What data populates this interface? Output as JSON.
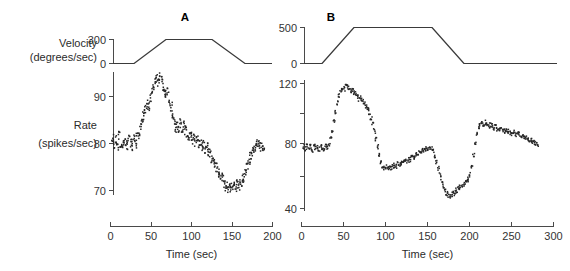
{
  "figure": {
    "width": 570,
    "height": 271,
    "background": "#ffffff",
    "ink_color": "#333333"
  },
  "labels": {
    "velocity_line1": "Velocity",
    "velocity_line2": "(degrees/sec)",
    "rate_line1": "Rate",
    "rate_line2": "(spikes/sec)",
    "panel_a_letter": "A",
    "panel_b_letter": "B",
    "xaxis_title_a": "Time (sec)",
    "xaxis_title_b": "Time (sec)"
  },
  "panelA": {
    "velocity_ticks": [
      "300",
      "0"
    ],
    "rate_ticks": [
      "90",
      "80",
      "70"
    ],
    "time_ticks": [
      "0",
      "50",
      "100",
      "150",
      "200"
    ]
  },
  "panelB": {
    "velocity_ticks": [
      "500",
      "0"
    ],
    "rate_ticks": [
      "120",
      "80",
      "40"
    ],
    "time_ticks": [
      "0",
      "50",
      "100",
      "150",
      "200",
      "250",
      "300"
    ]
  },
  "chart_data": [
    {
      "type": "line",
      "id": "panel-a-velocity",
      "title": "A",
      "xlabel": "Time (sec)",
      "ylabel": "Velocity (degrees/sec)",
      "xlim": [
        0,
        200
      ],
      "ylim": [
        0,
        300
      ],
      "grid": false,
      "legend": "none",
      "series": [
        {
          "name": "stimulus velocity",
          "x": [
            0,
            25,
            65,
            122,
            165,
            200
          ],
          "values": [
            0,
            0,
            300,
            300,
            0,
            0
          ]
        }
      ]
    },
    {
      "type": "scatter",
      "id": "panel-a-rate",
      "xlabel": "Time (sec)",
      "ylabel": "Rate (spikes/sec)",
      "xlim": [
        0,
        200
      ],
      "ylim": [
        66,
        97
      ],
      "grid": false,
      "legend": "none",
      "series": [
        {
          "name": "firing rate",
          "x": [
            2,
            4,
            6,
            8,
            10,
            12,
            14,
            16,
            18,
            20,
            22,
            24,
            26,
            28,
            30,
            32,
            34,
            36,
            38,
            40,
            42,
            44,
            46,
            48,
            50,
            52,
            54,
            56,
            58,
            60,
            62,
            64,
            66,
            68,
            70,
            72,
            74,
            76,
            78,
            80,
            82,
            84,
            86,
            88,
            90,
            92,
            94,
            96,
            98,
            100,
            102,
            104,
            106,
            108,
            110,
            112,
            114,
            116,
            118,
            120,
            122,
            124,
            126,
            128,
            130,
            132,
            134,
            136,
            138,
            140,
            142,
            144,
            146,
            148,
            150,
            152,
            154,
            156,
            158,
            160,
            162,
            164,
            166,
            168,
            170,
            172,
            174,
            176,
            178,
            180,
            182,
            184,
            186,
            188
          ],
          "values": [
            81.5,
            80.0,
            81.0,
            79.5,
            81.8,
            80.2,
            79.0,
            81.2,
            80.5,
            79.8,
            81.0,
            80.4,
            79.6,
            81.3,
            80.0,
            81.5,
            82.0,
            84.0,
            85.5,
            86.0,
            87.5,
            88.5,
            88.0,
            89.5,
            91.0,
            92.5,
            93.5,
            94.0,
            93.0,
            94.5,
            93.5,
            92.0,
            91.5,
            90.5,
            91.0,
            89.0,
            88.0,
            86.0,
            85.0,
            83.5,
            84.0,
            83.0,
            84.5,
            83.5,
            84.0,
            83.0,
            82.5,
            81.5,
            82.0,
            81.0,
            81.5,
            80.5,
            81.0,
            80.0,
            80.5,
            79.5,
            80.0,
            79.0,
            79.5,
            78.5,
            78.0,
            77.0,
            76.5,
            75.5,
            75.0,
            74.0,
            73.5,
            73.0,
            72.5,
            71.5,
            71.0,
            70.5,
            71.0,
            70.8,
            70.5,
            71.0,
            70.8,
            71.5,
            71.0,
            72.0,
            72.5,
            73.0,
            74.0,
            75.5,
            76.5,
            77.5,
            78.5,
            79.0,
            79.5,
            80.0,
            80.5,
            79.5,
            80.0,
            79.0
          ]
        }
      ]
    },
    {
      "type": "line",
      "id": "panel-b-velocity",
      "title": "B",
      "xlabel": "Time (sec)",
      "ylabel": "Velocity (degrees/sec)",
      "xlim": [
        0,
        300
      ],
      "ylim": [
        0,
        500
      ],
      "grid": false,
      "legend": "none",
      "series": [
        {
          "name": "stimulus velocity",
          "x": [
            0,
            22,
            60,
            152,
            190,
            300
          ],
          "values": [
            0,
            0,
            500,
            500,
            0,
            0
          ]
        }
      ]
    },
    {
      "type": "scatter",
      "id": "panel-b-rate",
      "xlabel": "Time (sec)",
      "ylabel": "Rate (spikes/sec)",
      "xlim": [
        0,
        300
      ],
      "ylim": [
        38,
        125
      ],
      "grid": false,
      "legend": "none",
      "series": [
        {
          "name": "firing rate",
          "x": [
            2,
            4,
            6,
            8,
            10,
            12,
            14,
            16,
            18,
            20,
            22,
            24,
            26,
            28,
            30,
            32,
            34,
            36,
            38,
            40,
            42,
            44,
            46,
            48,
            50,
            52,
            54,
            56,
            58,
            60,
            62,
            64,
            66,
            68,
            70,
            72,
            74,
            76,
            78,
            80,
            82,
            84,
            86,
            88,
            90,
            92,
            94,
            96,
            98,
            100,
            102,
            104,
            106,
            108,
            110,
            112,
            114,
            116,
            118,
            120,
            122,
            124,
            126,
            128,
            130,
            132,
            134,
            136,
            138,
            140,
            142,
            144,
            146,
            148,
            150,
            152,
            154,
            156,
            158,
            160,
            162,
            164,
            166,
            168,
            170,
            172,
            174,
            176,
            178,
            180,
            182,
            184,
            186,
            188,
            190,
            192,
            194,
            196,
            198,
            200,
            202,
            204,
            206,
            208,
            210,
            212,
            214,
            216,
            218,
            220,
            222,
            224,
            226,
            228,
            230,
            232,
            234,
            236,
            238,
            240,
            242,
            244,
            246,
            248,
            250,
            252,
            254,
            256,
            258,
            260,
            262,
            264,
            266,
            268,
            270,
            272,
            274,
            276,
            278,
            280
          ],
          "values": [
            80.0,
            78.5,
            81.0,
            79.0,
            80.5,
            78.0,
            81.5,
            79.5,
            80.0,
            78.5,
            80.5,
            79.0,
            78.0,
            80.0,
            79.5,
            81.0,
            85.0,
            90.0,
            96.0,
            102.0,
            108.0,
            113.0,
            116.0,
            118.0,
            117.0,
            119.0,
            118.0,
            117.5,
            116.0,
            117.0,
            115.0,
            114.0,
            112.0,
            110.5,
            111.0,
            109.0,
            107.5,
            106.0,
            104.0,
            102.0,
            98.0,
            94.0,
            90.0,
            85.0,
            80.0,
            75.0,
            70.5,
            68.0,
            66.5,
            67.0,
            66.0,
            67.5,
            66.5,
            67.0,
            68.0,
            67.5,
            69.0,
            68.5,
            70.0,
            69.5,
            71.0,
            70.5,
            72.0,
            71.5,
            73.0,
            74.0,
            73.5,
            75.0,
            76.0,
            75.5,
            77.0,
            78.0,
            77.5,
            79.0,
            78.0,
            79.5,
            78.5,
            77.0,
            74.0,
            70.0,
            66.0,
            62.0,
            58.0,
            55.0,
            52.0,
            50.0,
            49.0,
            48.5,
            49.5,
            50.0,
            51.0,
            52.0,
            53.0,
            54.0,
            55.0,
            56.0,
            57.5,
            58.0,
            59.0,
            62.0,
            68.0,
            75.0,
            82.0,
            88.0,
            92.0,
            94.0,
            95.0,
            94.0,
            95.5,
            94.5,
            93.0,
            94.0,
            93.5,
            92.0,
            92.5,
            91.0,
            91.5,
            90.5,
            91.0,
            90.0,
            90.5,
            89.5,
            90.0,
            89.0,
            88.5,
            89.0,
            88.0,
            87.5,
            88.0,
            87.0,
            86.5,
            86.0,
            85.5,
            85.0,
            84.5,
            84.0,
            83.5,
            83.0,
            82.0,
            81.0
          ]
        }
      ]
    }
  ]
}
